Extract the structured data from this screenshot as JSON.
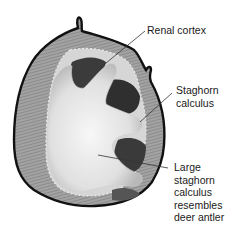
{
  "diagram": {
    "labels": {
      "renal_cortex": "Renal cortex",
      "staghorn_calculus": "Staghorn\ncalculus",
      "large_staghorn": "Large\nstaghorn\ncalculus\nresembles\ndeer antler"
    },
    "colors": {
      "outline": "#111111",
      "cortex": "#9a9a9a",
      "cortex_striation": "#7a7a7a",
      "calyx_dark": "#3a3a3a",
      "stone_light": "#ececec",
      "stone_shadow": "#bdbdbd",
      "leader_line": "#333333"
    }
  }
}
